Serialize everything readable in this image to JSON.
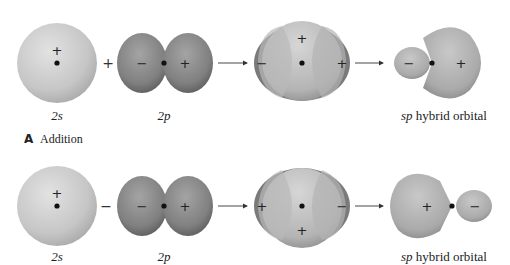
{
  "rows": [
    {
      "operator": "+",
      "s_orbital": {
        "label": "2s",
        "sign": "+"
      },
      "p_orbital": {
        "label": "2p",
        "left_sign": "−",
        "right_sign": "+"
      },
      "overlap": {
        "top_or_bottom_sign": "+",
        "left_sign": "−",
        "right_sign": "+"
      },
      "hybrid": {
        "label_italic": "sp",
        "label_rest": " hybrid orbital",
        "small_lobe_sign": "−",
        "large_lobe_sign": "+",
        "small_lobe_side": "left"
      }
    },
    {
      "operator": "−",
      "s_orbital": {
        "label": "2s",
        "sign": "+"
      },
      "p_orbital": {
        "label": "2p",
        "left_sign": "−",
        "right_sign": "+"
      },
      "overlap": {
        "top_or_bottom_sign": "+",
        "left_sign": "+",
        "right_sign": "−"
      },
      "hybrid": {
        "label_italic": "sp",
        "label_rest": " hybrid orbital",
        "small_lobe_sign": "−",
        "large_lobe_sign": "+",
        "small_lobe_side": "right"
      }
    }
  ],
  "panel": {
    "letter": "A",
    "title": "Addition"
  },
  "colors": {
    "s_light": "#d8d8d8",
    "s_dark": "#a8a8a8",
    "p_light": "#9a9a9a",
    "p_dark": "#5e5e5e",
    "nucleus": "#111111",
    "arrow": "#333333"
  }
}
